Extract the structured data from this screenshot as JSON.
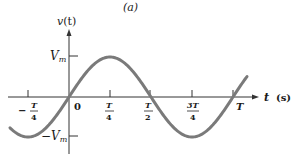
{
  "chart_data": {
    "type": "line",
    "title": "(a)",
    "xlabel": "t  (s)",
    "ylabel": "v(t)",
    "series": [
      {
        "name": "v(t) = Vm sin(2πt/T)",
        "color": "#7a7a7a",
        "x": [
          "-T/3",
          "-T/4",
          "0",
          "T/4",
          "T/2",
          "3T/4",
          "T",
          "1.08T"
        ],
        "values": [
          -0.87,
          -1,
          0,
          1,
          0,
          -1,
          0,
          0.48
        ]
      }
    ],
    "x_ticks": [
      "-T/4",
      "0",
      "T/4",
      "T/2",
      "3T/4",
      "T"
    ],
    "y_ticks": [
      "Vm",
      "-Vm"
    ],
    "ylim": [
      -1.2,
      1.6
    ],
    "grid": false,
    "legend": "none"
  },
  "labels": {
    "title": "(a)",
    "y_axis_v": "v",
    "y_axis_t": "(t)",
    "x_axis_t": "t",
    "x_axis_unit": "(s)",
    "vm": "V",
    "vm_sub": "m",
    "neg_vm": "−V",
    "neg_vm_sub": "m",
    "tick_neg_quarter_minus": "−",
    "tick_T": "T",
    "tick_4": "4",
    "tick_2": "2",
    "tick_3T": "3T",
    "tick_zero": "0"
  }
}
